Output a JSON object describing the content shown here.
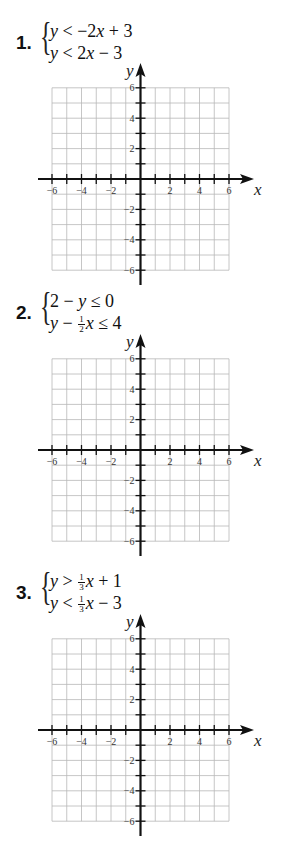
{
  "problems": [
    {
      "number": "1.",
      "lines": [
        {
          "lhs": "y",
          "op": "<",
          "rhs": "−2x + 3"
        },
        {
          "lhs": "y",
          "op": "<",
          "rhs": "2x − 3"
        }
      ],
      "system_text": [
        "y < −2x + 3",
        "y < 2x − 3"
      ]
    },
    {
      "number": "2.",
      "lines": [
        {
          "lhs": "2 − y",
          "op": "≤",
          "rhs": "0"
        },
        {
          "lhs": "y − ½x",
          "op": "≤",
          "rhs": "4"
        }
      ],
      "system_text": [
        "2 − y ≤ 0",
        "y − ½x ≤ 4"
      ]
    },
    {
      "number": "3.",
      "lines": [
        {
          "lhs": "y",
          "op": ">",
          "rhs": "⅓x + 1"
        },
        {
          "lhs": "y",
          "op": "<",
          "rhs": "⅓x − 3"
        }
      ],
      "system_text": [
        "y > ⅓x + 1",
        "y < ⅓x − 3"
      ]
    }
  ],
  "graph": {
    "x_label": "x",
    "y_label": "y",
    "x_range": [
      -6,
      6
    ],
    "y_range": [
      -6,
      6
    ],
    "x_tick_labels": [
      "−6",
      "−4",
      "−2",
      "2",
      "4",
      "6"
    ],
    "y_tick_labels": [
      "6",
      "4",
      "2",
      "−2",
      "−4",
      "−6"
    ],
    "grid_color": "#b8b8b8",
    "axis_color": "#111111"
  },
  "fractions": {
    "half_num": "1",
    "half_den": "2",
    "third_num": "1",
    "third_den": "3"
  },
  "text": {
    "p1_l1_a": "y",
    "p1_l1_b": " < −2",
    "p1_l1_c": "x",
    "p1_l1_d": " + 3",
    "p1_l2_a": "y",
    "p1_l2_b": " < 2",
    "p1_l2_c": "x",
    "p1_l2_d": " − 3",
    "p2_l1_a": "2 − ",
    "p2_l1_b": "y",
    "p2_l1_c": " ≤ 0",
    "p2_l2_a": "y",
    "p2_l2_b": " − ",
    "p2_l2_c": "x",
    "p2_l2_d": " ≤ 4",
    "p3_l1_a": "y",
    "p3_l1_b": " > ",
    "p3_l1_c": "x",
    "p3_l1_d": " + 1",
    "p3_l2_a": "y",
    "p3_l2_b": " < ",
    "p3_l2_c": "x",
    "p3_l2_d": " − 3"
  }
}
